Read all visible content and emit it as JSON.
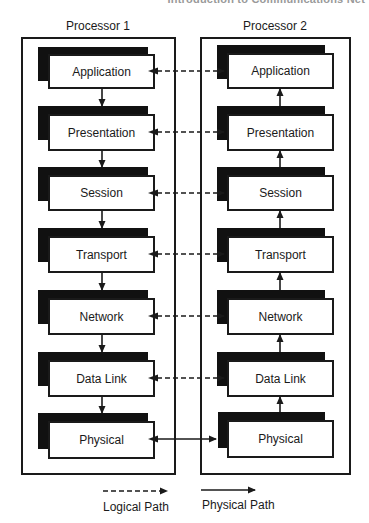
{
  "header": {
    "running_title": "Introduction to Communications Net"
  },
  "diagram": {
    "processors": [
      {
        "label": "Processor 1",
        "flow_direction": "down",
        "layers": [
          "Application",
          "Presentation",
          "Session",
          "Transport",
          "Network",
          "Data Link",
          "Physical"
        ]
      },
      {
        "label": "Processor 2",
        "flow_direction": "up",
        "layers": [
          "Application",
          "Presentation",
          "Session",
          "Transport",
          "Network",
          "Data Link",
          "Physical"
        ]
      }
    ],
    "connections": [
      {
        "from": "Processor 1 Application",
        "to": "Processor 2 Application",
        "type": "logical",
        "bidirectional": true
      },
      {
        "from": "Processor 1 Presentation",
        "to": "Processor 2 Presentation",
        "type": "logical",
        "bidirectional": true
      },
      {
        "from": "Processor 1 Session",
        "to": "Processor 2 Session",
        "type": "logical",
        "bidirectional": true
      },
      {
        "from": "Processor 1 Transport",
        "to": "Processor 2 Transport",
        "type": "logical",
        "bidirectional": true
      },
      {
        "from": "Processor 1 Network",
        "to": "Processor 2 Network",
        "type": "logical",
        "bidirectional": true
      },
      {
        "from": "Processor 1 Data Link",
        "to": "Processor 2 Data Link",
        "type": "logical",
        "bidirectional": true
      },
      {
        "from": "Processor 1 Physical",
        "to": "Processor 2 Physical",
        "type": "physical",
        "bidirectional": true
      }
    ]
  },
  "legend": {
    "logical": "Logical Path",
    "physical": "Physical Path"
  },
  "colors": {
    "ink": "#1a1a1a",
    "shadow": "#111111",
    "background": "#ffffff"
  }
}
